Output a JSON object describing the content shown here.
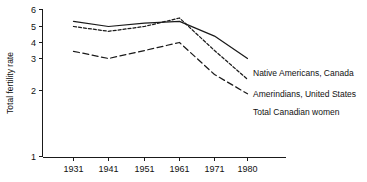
{
  "chart_data": {
    "type": "line",
    "title": "",
    "xlabel": "",
    "ylabel": "Total fertility rate",
    "x": [
      1931,
      1941,
      1951,
      1961,
      1971,
      1980
    ],
    "xtick_labels": [
      "1931",
      "1941",
      "1951",
      "1961",
      "1971",
      "1980"
    ],
    "ytick_labels": [
      "6",
      "5",
      "4",
      "3",
      "2",
      "1"
    ],
    "ytick_values": [
      6,
      5,
      4,
      3,
      2,
      1
    ],
    "ylim": [
      1,
      6
    ],
    "grid": false,
    "legend_position": "right-inline",
    "axis_note": "non-linear compressed y-axis: equal spacing 6-5-4-3, then larger gaps 3-2 and 2-1",
    "series": [
      {
        "name": "Native Americans, Canada",
        "style": "solid",
        "values": [
          5.3,
          5.0,
          5.2,
          5.3,
          4.4,
          3.0
        ]
      },
      {
        "name": "Amerindians, United States",
        "style": "dotted",
        "values": [
          5.0,
          4.7,
          5.0,
          5.5,
          3.5,
          2.35
        ]
      },
      {
        "name": "Total Canadian women",
        "style": "dashed",
        "values": [
          3.45,
          3.0,
          3.5,
          4.0,
          2.5,
          1.95
        ]
      }
    ]
  },
  "axes": {
    "y_title": "Total fertility rate",
    "y_ticks": [
      {
        "label": "6"
      },
      {
        "label": "5"
      },
      {
        "label": "4"
      },
      {
        "label": "3"
      },
      {
        "label": "2"
      },
      {
        "label": "1"
      }
    ],
    "x_ticks": [
      {
        "label": "1931"
      },
      {
        "label": "1941"
      },
      {
        "label": "1951"
      },
      {
        "label": "1961"
      },
      {
        "label": "1971"
      },
      {
        "label": "1980"
      }
    ]
  },
  "legend": {
    "items": [
      {
        "label": "Native Americans, Canada"
      },
      {
        "label": "Amerindians, United States"
      },
      {
        "label": "Total Canadian women"
      }
    ]
  }
}
